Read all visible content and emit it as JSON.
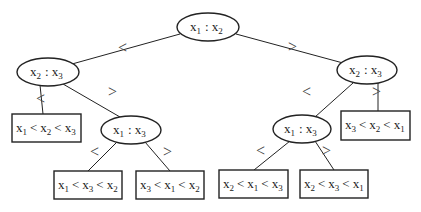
{
  "diagram": {
    "type": "decision-tree",
    "colors": {
      "stroke": "#222222",
      "background": "#ffffff"
    },
    "nodes": [
      {
        "id": "root",
        "kind": "comparison",
        "a": "x",
        "a_sub": "1",
        "op": ":",
        "b": "x",
        "b_sub": "2"
      },
      {
        "id": "L",
        "kind": "comparison",
        "a": "x",
        "a_sub": "2",
        "op": ":",
        "b": "x",
        "b_sub": "3"
      },
      {
        "id": "R",
        "kind": "comparison",
        "a": "x",
        "a_sub": "2",
        "op": ":",
        "b": "x",
        "b_sub": "3"
      },
      {
        "id": "LL",
        "kind": "leaf",
        "order": [
          "1",
          "2",
          "3"
        ],
        "text": "x1 < x2 < x3"
      },
      {
        "id": "LR",
        "kind": "comparison",
        "a": "x",
        "a_sub": "1",
        "op": ":",
        "b": "x",
        "b_sub": "3"
      },
      {
        "id": "LRL",
        "kind": "leaf",
        "order": [
          "1",
          "3",
          "2"
        ],
        "text": "x1 < x3 < x2"
      },
      {
        "id": "LRR",
        "kind": "leaf",
        "order": [
          "3",
          "1",
          "2"
        ],
        "text": "x3 < x1 < x2"
      },
      {
        "id": "RL",
        "kind": "comparison",
        "a": "x",
        "a_sub": "1",
        "op": ":",
        "b": "x",
        "b_sub": "3"
      },
      {
        "id": "RR",
        "kind": "leaf",
        "order": [
          "3",
          "2",
          "1"
        ],
        "text": "x3 < x2 < x1"
      },
      {
        "id": "RLL",
        "kind": "leaf",
        "order": [
          "2",
          "1",
          "3"
        ],
        "text": "x2 < x1 < x3"
      },
      {
        "id": "RLR",
        "kind": "leaf",
        "order": [
          "2",
          "3",
          "1"
        ],
        "text": "x2 < x3 < x1"
      }
    ],
    "edges": [
      {
        "from": "root",
        "to": "L",
        "label": "<"
      },
      {
        "from": "root",
        "to": "R",
        "label": ">"
      },
      {
        "from": "L",
        "to": "LL",
        "label": "<"
      },
      {
        "from": "L",
        "to": "LR",
        "label": ">"
      },
      {
        "from": "LR",
        "to": "LRL",
        "label": "<"
      },
      {
        "from": "LR",
        "to": "LRR",
        "label": ">"
      },
      {
        "from": "R",
        "to": "RL",
        "label": "<"
      },
      {
        "from": "R",
        "to": "RR",
        "label": ">"
      },
      {
        "from": "RL",
        "to": "RLL",
        "label": "<"
      },
      {
        "from": "RL",
        "to": "RLR",
        "label": ">"
      }
    ],
    "symbols": {
      "var": "x",
      "colon": ":",
      "lt": "<",
      "gt": ">"
    }
  }
}
